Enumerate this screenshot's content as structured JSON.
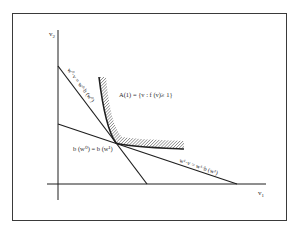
{
  "diagram": {
    "type": "economics-isoquant",
    "axes": {
      "x_label": "v",
      "x_sub": "1",
      "y_label": "v",
      "y_sub": "2"
    },
    "region_label": "A(1) = {v : f (v)≥ 1}",
    "intersection_label": "b (w⁰) = b (w¹)",
    "line_w0_label": "w⁰·v = w⁰·b (w⁰)",
    "line_w1_label": "w¹·v = w¹·b (w¹)",
    "colors": {
      "ink": "#1e1e1e",
      "frame": "#3a3a3a",
      "hatch": "#555555",
      "background": "#ffffff"
    }
  }
}
